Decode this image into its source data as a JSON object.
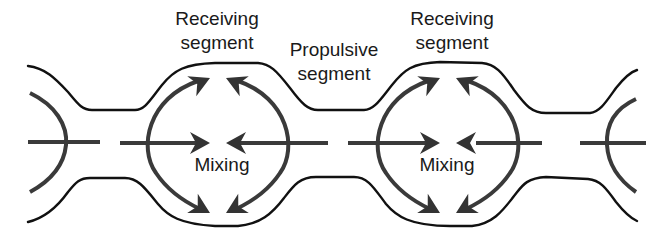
{
  "diagram": {
    "labels": {
      "receiving_left": [
        "Receiving",
        "segment"
      ],
      "propulsive": [
        "Propulsive",
        "segment"
      ],
      "receiving_right": [
        "Receiving",
        "segment"
      ],
      "mixing_left": "Mixing",
      "mixing_right": "Mixing"
    },
    "colors": {
      "wall": "#111111",
      "flow_arrows": "#333333",
      "background": "#ffffff"
    },
    "elements": [
      {
        "name": "intestinal-wall-top",
        "kind": "wall"
      },
      {
        "name": "intestinal-wall-bottom",
        "kind": "wall"
      },
      {
        "name": "mixing-cell-left",
        "kind": "circulating-arrows",
        "arrows": 6
      },
      {
        "name": "mixing-cell-right",
        "kind": "circulating-arrows",
        "arrows": 6
      },
      {
        "name": "partial-cell-left-edge",
        "kind": "arc"
      },
      {
        "name": "partial-cell-right-edge",
        "kind": "arc"
      },
      {
        "name": "lumen-center-axis",
        "kind": "dashed-line"
      }
    ]
  }
}
